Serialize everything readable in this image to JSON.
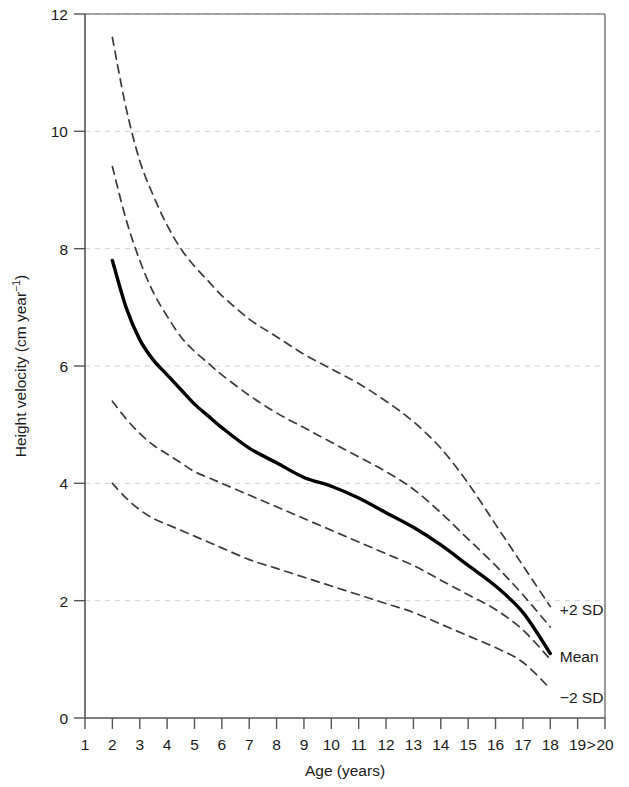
{
  "chart_data": {
    "type": "line",
    "title": "",
    "xlabel": "Age (years)",
    "ylabel": "Height velocity (cm year⁻¹)",
    "ylabel_main": "Height velocity (cm year",
    "ylabel_sup": "−1",
    "ylabel_tail": ")",
    "xlim": [
      1,
      20
    ],
    "ylim": [
      0,
      12
    ],
    "grid": true,
    "grid_axis": "y",
    "legend_position": "right-inline",
    "x_tick_labels": [
      "1",
      "2",
      "3",
      "4",
      "5",
      "6",
      "7",
      "8",
      "9",
      "10",
      "11",
      "12",
      "13",
      "14",
      "15",
      "16",
      "17",
      "18",
      "19",
      "20"
    ],
    "x_tick_values": [
      1,
      2,
      3,
      4,
      5,
      6,
      7,
      8,
      9,
      10,
      11,
      12,
      13,
      14,
      15,
      16,
      17,
      18,
      19,
      20
    ],
    "x_extra_marker": ">",
    "x_extra_marker_position": 19.5,
    "y_tick_labels": [
      "0",
      "2",
      "4",
      "6",
      "8",
      "10",
      "12"
    ],
    "y_tick_values": [
      0,
      2,
      4,
      6,
      8,
      10,
      12
    ],
    "colors": {
      "curve": "#000000",
      "dashed_curve": "#3a3a3a",
      "axis": "#555555",
      "grid": "#cfcfd6",
      "text": "#1a1a1a"
    },
    "annotations": [
      {
        "text": "+2 SD",
        "x": 18.35,
        "y": 1.85
      },
      {
        "text": "Mean",
        "x": 18.35,
        "y": 1.05
      },
      {
        "text": "−2 SD",
        "x": 18.35,
        "y": 0.35
      }
    ],
    "series": [
      {
        "name": "+2 SD",
        "style": "dashed",
        "x": [
          2,
          2.5,
          3,
          3.5,
          4,
          4.5,
          5,
          5.5,
          6,
          7,
          8,
          9,
          10,
          11,
          12,
          13,
          14,
          15,
          16,
          17,
          18
        ],
        "values": [
          11.6,
          10.4,
          9.5,
          8.9,
          8.4,
          8.0,
          7.7,
          7.45,
          7.2,
          6.8,
          6.5,
          6.2,
          5.95,
          5.7,
          5.4,
          5.05,
          4.6,
          4.0,
          3.3,
          2.6,
          1.9
        ]
      },
      {
        "name": "+1 SD",
        "style": "dashed",
        "x": [
          2,
          2.5,
          3,
          3.5,
          4,
          4.5,
          5,
          5.5,
          6,
          7,
          8,
          9,
          10,
          11,
          12,
          13,
          14,
          15,
          16,
          17,
          18
        ],
        "values": [
          9.4,
          8.5,
          7.8,
          7.25,
          6.85,
          6.5,
          6.25,
          6.05,
          5.85,
          5.5,
          5.2,
          4.95,
          4.7,
          4.45,
          4.2,
          3.9,
          3.5,
          3.05,
          2.6,
          2.1,
          1.55
        ]
      },
      {
        "name": "Mean",
        "style": "solid",
        "x": [
          2,
          2.5,
          3,
          3.5,
          4,
          4.5,
          5,
          5.5,
          6,
          7,
          8,
          9,
          10,
          11,
          12,
          13,
          14,
          15,
          16,
          17,
          18
        ],
        "values": [
          7.8,
          7.0,
          6.45,
          6.1,
          5.85,
          5.6,
          5.35,
          5.15,
          4.95,
          4.6,
          4.35,
          4.1,
          3.95,
          3.75,
          3.5,
          3.25,
          2.95,
          2.6,
          2.25,
          1.8,
          1.1
        ]
      },
      {
        "name": "−1 SD",
        "style": "dashed",
        "x": [
          2,
          2.5,
          3,
          3.5,
          4,
          4.5,
          5,
          5.5,
          6,
          7,
          8,
          9,
          10,
          11,
          12,
          13,
          14,
          15,
          16,
          17,
          18
        ],
        "values": [
          5.4,
          5.1,
          4.85,
          4.65,
          4.5,
          4.35,
          4.2,
          4.1,
          4.0,
          3.8,
          3.6,
          3.4,
          3.2,
          3.0,
          2.8,
          2.6,
          2.35,
          2.1,
          1.85,
          1.5,
          1.0
        ]
      },
      {
        "name": "−2 SD",
        "style": "dashed",
        "x": [
          2,
          2.5,
          3,
          3.5,
          4,
          4.5,
          5,
          5.5,
          6,
          7,
          8,
          9,
          10,
          11,
          12,
          13,
          14,
          15,
          16,
          17,
          18
        ],
        "values": [
          4.0,
          3.75,
          3.55,
          3.4,
          3.3,
          3.2,
          3.1,
          3.0,
          2.9,
          2.7,
          2.55,
          2.4,
          2.25,
          2.1,
          1.95,
          1.8,
          1.6,
          1.4,
          1.2,
          0.95,
          0.5
        ]
      }
    ]
  }
}
